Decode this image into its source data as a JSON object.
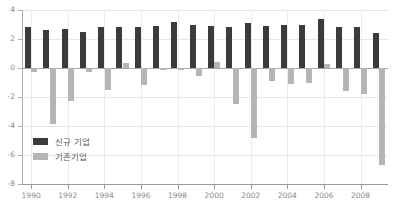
{
  "chart_data": {
    "type": "bar",
    "title": "",
    "subtitle": "",
    "xlabel": "",
    "ylabel": "",
    "ylim": [
      -8,
      4
    ],
    "ytick_values": [
      4,
      2,
      0,
      -2,
      -4,
      -6,
      -8
    ],
    "ytick_labels": [
      "4",
      "2",
      "0",
      "-2",
      "-4",
      "-6",
      "-8"
    ],
    "grid": true,
    "grid_axis": "both",
    "legend_position": "inside-lower-left",
    "zero_line": true,
    "categories": [
      "1990",
      "1991",
      "1992",
      "1993",
      "1994",
      "1995",
      "1996",
      "1997",
      "1998",
      "1999",
      "2000",
      "2001",
      "2002",
      "2003",
      "2004",
      "2005",
      "2006",
      "2007",
      "2008",
      "2009"
    ],
    "xtick_labels": [
      "1990",
      "1992",
      "1994",
      "1996",
      "1998",
      "2000",
      "2002",
      "2004",
      "2006",
      "2008"
    ],
    "xtick_categories": [
      "1990",
      "1992",
      "1994",
      "1996",
      "1998",
      "2000",
      "2002",
      "2004",
      "2006",
      "2008"
    ],
    "series": [
      {
        "name": "신규 기업",
        "color": "#3b3b3b",
        "values": [
          2.8,
          2.6,
          2.7,
          2.5,
          2.8,
          2.85,
          2.8,
          2.9,
          3.2,
          2.95,
          2.9,
          2.8,
          3.1,
          2.9,
          2.95,
          3.0,
          3.35,
          2.85,
          2.85,
          2.4
        ]
      },
      {
        "name": "기존기업",
        "color": "#b5b5b5",
        "values": [
          -0.3,
          -3.85,
          -2.3,
          -0.25,
          -1.5,
          0.35,
          -1.2,
          -0.15,
          -0.1,
          -0.55,
          0.4,
          -2.5,
          -4.8,
          -0.9,
          -1.1,
          -1.0,
          0.25,
          -1.6,
          -1.8,
          -6.7
        ]
      }
    ]
  },
  "legend": {
    "items": [
      {
        "label": "신규 기업",
        "color": "#3b3b3b"
      },
      {
        "label": "기존기업",
        "color": "#b5b5b5"
      }
    ]
  },
  "colors": {
    "series_new": "#3b3b3b",
    "series_existing": "#b5b5b5",
    "axis": "#9a9a9a",
    "grid": "#e6e6e6",
    "tick_text": "#8a8a8a",
    "legend_text": "#606060",
    "background": "#ffffff"
  }
}
